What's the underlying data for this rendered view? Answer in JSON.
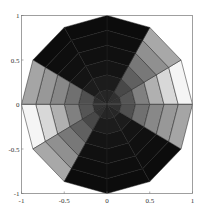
{
  "chart_data": {
    "type": "heatmap",
    "subtype": "polar-surface-top-view",
    "title": "",
    "xlabel": "",
    "ylabel": "",
    "xlim": [
      -1,
      1
    ],
    "ylim": [
      -1,
      1
    ],
    "grid": false,
    "legend": null,
    "xticks": [
      "-1",
      "-0.5",
      "0",
      "0.5",
      "1"
    ],
    "yticks": [
      "1",
      "0.5",
      "0",
      "-0.5",
      "-1"
    ],
    "polygon_sides": 12,
    "rings": 6,
    "sector_angles_deg": [
      0,
      30,
      60,
      90,
      120,
      150,
      180,
      210,
      240,
      270,
      300,
      330
    ],
    "gray_levels": [
      [
        51,
        85,
        128,
        176,
        216,
        245
      ],
      [
        48,
        72,
        96,
        120,
        144,
        168
      ],
      [
        38,
        28,
        20,
        16,
        14,
        12
      ],
      [
        38,
        28,
        20,
        16,
        14,
        12
      ],
      [
        38,
        28,
        20,
        16,
        14,
        12
      ],
      [
        48,
        80,
        112,
        136,
        152,
        165
      ],
      [
        51,
        85,
        128,
        176,
        216,
        245
      ],
      [
        48,
        72,
        96,
        120,
        144,
        168
      ],
      [
        38,
        28,
        20,
        16,
        14,
        12
      ],
      [
        38,
        28,
        20,
        16,
        14,
        12
      ],
      [
        38,
        28,
        20,
        16,
        14,
        12
      ],
      [
        48,
        80,
        112,
        136,
        152,
        165
      ]
    ]
  },
  "axes": {
    "x_ticks": [
      {
        "label": "-1",
        "value": -1
      },
      {
        "label": "-0.5",
        "value": -0.5
      },
      {
        "label": "0",
        "value": 0
      },
      {
        "label": "0.5",
        "value": 0.5
      },
      {
        "label": "1",
        "value": 1
      }
    ],
    "y_ticks": [
      {
        "label": "1",
        "value": 1
      },
      {
        "label": "0.5",
        "value": 0.5
      },
      {
        "label": "0",
        "value": 0
      },
      {
        "label": "-0.5",
        "value": -0.5
      },
      {
        "label": "-1",
        "value": -1
      }
    ]
  }
}
